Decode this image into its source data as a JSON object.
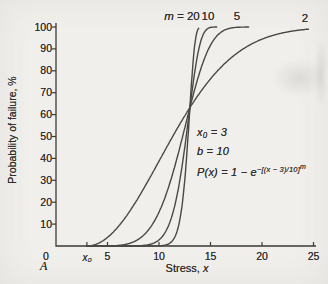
{
  "figure": {
    "panel_label": "A",
    "colors": {
      "background": "#f1efec",
      "ink": "#3b3a38",
      "curve": "#4a4846"
    }
  },
  "chart_data": {
    "type": "line",
    "title": "",
    "xlabel_text": "Stress, ",
    "xlabel_var": "x",
    "ylabel": "Probability of failure, %",
    "xlim": [
      0,
      25
    ],
    "ylim": [
      0,
      100
    ],
    "grid": false,
    "x_ticks": [
      0,
      5,
      10,
      15,
      20,
      25
    ],
    "x0_tick": {
      "label": "x₀",
      "value": 3
    },
    "y_ticks": [
      10,
      20,
      30,
      40,
      50,
      60,
      70,
      80,
      90,
      100
    ],
    "m_label_prefix": "m = ",
    "model": {
      "x0": 3,
      "b": 10,
      "formula_text": "P(x) = 1 − e−[(x−3)/10]^m"
    },
    "annotations": {
      "x0": "x₀ = 3",
      "b": "b = 10",
      "formula_base": "P(x) = 1 − e",
      "formula_exponent": "−[(x − 3)/10]",
      "formula_exponent_power": "m"
    },
    "crossing_point": {
      "x": 13,
      "p_percent": 63.2
    },
    "series": [
      {
        "name": "m = 20",
        "m": 20,
        "label": "20",
        "x_end": 13.85,
        "points": [
          [
            10,
            0.1
          ],
          [
            11,
            1.1
          ],
          [
            12,
            11.5
          ],
          [
            12.5,
            30.1
          ],
          [
            13,
            63.2
          ],
          [
            13.5,
            93.0
          ],
          [
            13.9,
            99.6
          ]
        ]
      },
      {
        "name": "m = 10",
        "m": 10,
        "label": "10",
        "x_end": 15.6,
        "points": [
          [
            8,
            0.1
          ],
          [
            9,
            0.6
          ],
          [
            10,
            2.8
          ],
          [
            11,
            10.2
          ],
          [
            12,
            29.5
          ],
          [
            13,
            63.2
          ],
          [
            14,
            92.5
          ],
          [
            15,
            99.8
          ]
        ]
      },
      {
        "name": "m = 5",
        "m": 5,
        "label": "5",
        "x_end": 18.7,
        "points": [
          [
            5,
            0.03
          ],
          [
            6,
            0.2
          ],
          [
            7,
            1.0
          ],
          [
            8,
            3.1
          ],
          [
            9,
            7.5
          ],
          [
            10,
            15.5
          ],
          [
            11,
            27.9
          ],
          [
            12,
            44.6
          ],
          [
            13,
            63.2
          ],
          [
            14,
            80.0
          ],
          [
            15,
            91.7
          ],
          [
            16,
            97.6
          ],
          [
            17,
            99.5
          ],
          [
            18,
            99.9
          ]
        ]
      },
      {
        "name": "m = 2",
        "m": 2,
        "label": "2",
        "x_end": 24.5,
        "points": [
          [
            4,
            1.0
          ],
          [
            5,
            3.9
          ],
          [
            6,
            8.6
          ],
          [
            7,
            14.8
          ],
          [
            8,
            22.1
          ],
          [
            9,
            30.2
          ],
          [
            10,
            38.7
          ],
          [
            11,
            47.3
          ],
          [
            12,
            55.5
          ],
          [
            13,
            63.2
          ],
          [
            14,
            70.2
          ],
          [
            15,
            76.3
          ],
          [
            16,
            81.5
          ],
          [
            17,
            85.9
          ],
          [
            18,
            89.5
          ],
          [
            19,
            92.3
          ],
          [
            20,
            94.4
          ],
          [
            21,
            96.1
          ],
          [
            22,
            97.3
          ],
          [
            23,
            98.2
          ],
          [
            24,
            98.8
          ]
        ]
      }
    ]
  }
}
